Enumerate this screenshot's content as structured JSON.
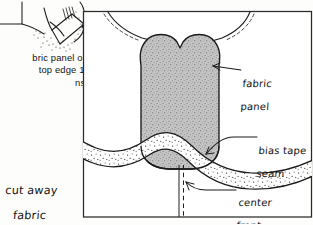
{
  "figure": {
    "kind": "sewing-pattern-illustration",
    "ink_color": "#1a1a1a",
    "paper_color": "#fdfdfb",
    "panel_fill_color": "#b9b9b9",
    "frame_color": "#2a2a2a"
  },
  "instruction_text": {
    "clipped_paragraph": "bric panel on\ntop edge 1″\nns."
  },
  "annotations": {
    "cut_away": {
      "line1": "cut away",
      "line2": "fabric",
      "line3": "extending",
      "line4": "above"
    },
    "fabric_panel": {
      "line1": "fabric",
      "line2": "panel"
    },
    "bias_tape": {
      "line1": "bias tape",
      "line2": "seam"
    },
    "center_front": {
      "line1": "center",
      "line2": "front"
    }
  },
  "parts": {
    "inset_sketch": "garment-corner-detail-inset",
    "frame": "diagram-frame-box",
    "neckline_left": "neckline-curve-left",
    "neckline_right": "neckline-curve-right",
    "fabric_panel_shape": "heart-top-fabric-panel",
    "bias_tape_band": "wavy-bias-tape-band",
    "center_front_line": "dashed-center-front-line",
    "leaders": [
      "fabric-panel-leader",
      "bias-tape-leader",
      "center-front-leader"
    ]
  }
}
